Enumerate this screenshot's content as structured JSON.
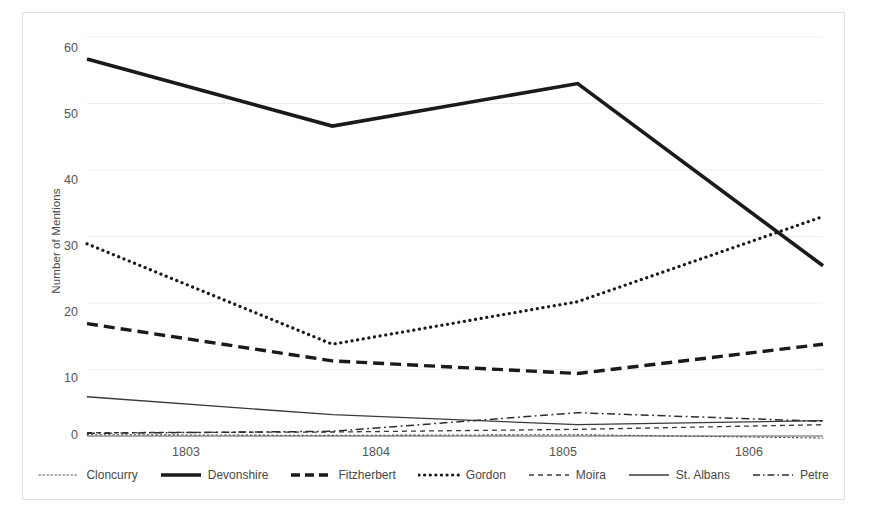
{
  "chart_data": {
    "type": "line",
    "title": "",
    "xlabel": "",
    "ylabel": "Number of Mentions",
    "categories": [
      "1803",
      "1804",
      "1805",
      "1806"
    ],
    "x": [
      1803,
      1804,
      1805,
      1806
    ],
    "ylim": [
      0,
      60
    ],
    "yticks": [
      0,
      10,
      20,
      30,
      40,
      50,
      60
    ],
    "ytick_labels": [
      "0",
      "10",
      "20",
      "30",
      "40",
      "50",
      "60"
    ],
    "grid": "horizontal",
    "legend_position": "bottom",
    "series": [
      {
        "name": "Cloncurry",
        "values": [
          0.2,
          0.1,
          0.2,
          -0.3
        ],
        "style": "dotted-thin",
        "color": "#4d4d4d",
        "width": 1.1
      },
      {
        "name": "Devonshire",
        "values": [
          56.7,
          46.6,
          53.0,
          25.6
        ],
        "style": "solid-thick",
        "color": "#1a1a1a",
        "width": 3.6
      },
      {
        "name": "Fitzherbert",
        "values": [
          16.9,
          11.3,
          9.4,
          13.8
        ],
        "style": "dashed-thick",
        "color": "#1a1a1a",
        "width": 3.4
      },
      {
        "name": "Gordon",
        "values": [
          28.9,
          13.8,
          20.2,
          33.0
        ],
        "style": "dotted-thick",
        "color": "#1a1a1a",
        "width": 3.2
      },
      {
        "name": "Moira",
        "values": [
          0.5,
          0.6,
          1.0,
          1.7
        ],
        "style": "dashed-thin",
        "color": "#3a3a3a",
        "width": 1.3
      },
      {
        "name": "St. Albans",
        "values": [
          5.9,
          3.2,
          1.7,
          2.3
        ],
        "style": "solid-thin",
        "color": "#3a3a3a",
        "width": 1.3
      },
      {
        "name": "Petre",
        "values": [
          0.4,
          0.7,
          3.5,
          2.2
        ],
        "style": "dash-dot",
        "color": "#2e2e2e",
        "width": 1.5
      }
    ],
    "colors": {
      "background": "#ffffff",
      "gridline": "#ededed",
      "axis_line": "#595959",
      "frame_border": "#e2e2e2",
      "text": "#545454"
    }
  }
}
